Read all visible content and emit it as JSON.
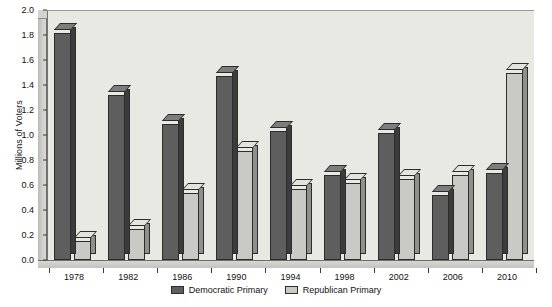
{
  "chart_data": {
    "type": "bar",
    "title": "",
    "xlabel": "",
    "ylabel": "Millions of Voters",
    "ylim": [
      0.0,
      2.0
    ],
    "ytick_labels": [
      "0.0",
      "0.2",
      "0.4",
      "0.6",
      "0.8",
      "1.0",
      "1.2",
      "1.4",
      "1.6",
      "1.8",
      "2.0"
    ],
    "ytick_values": [
      0.0,
      0.2,
      0.4,
      0.6,
      0.8,
      1.0,
      1.2,
      1.4,
      1.6,
      1.8,
      2.0
    ],
    "grid": false,
    "legend_position": "bottom-center",
    "categories": [
      "1978",
      "1982",
      "1986",
      "1990",
      "1994",
      "1998",
      "2002",
      "2006",
      "2010"
    ],
    "series": [
      {
        "name": "Democratic Primary",
        "color": "#5e5e5e",
        "values": [
          1.82,
          1.32,
          1.09,
          1.47,
          1.03,
          0.68,
          1.02,
          0.52,
          0.7
        ]
      },
      {
        "name": "Republican Primary",
        "color": "#c9c9c5",
        "values": [
          0.15,
          0.25,
          0.54,
          0.87,
          0.57,
          0.62,
          0.65,
          0.68,
          1.5
        ]
      }
    ]
  },
  "legend": {
    "items": [
      {
        "label": "Democratic Primary"
      },
      {
        "label": "Republican Primary"
      }
    ]
  }
}
